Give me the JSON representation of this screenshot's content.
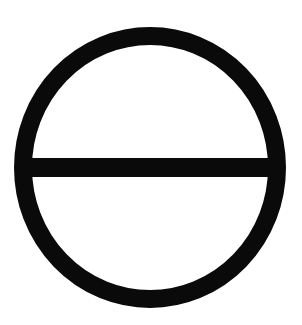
{
  "symbol": {
    "name": "circle-with-horizontal-bar",
    "colors": {
      "stroke": "#0a0a0a",
      "background": "#ffffff"
    },
    "circle": {
      "cx": 150,
      "cy": 167.5,
      "rx": 127,
      "ry": 131.5,
      "stroke_width": 18
    },
    "bar": {
      "x1": 28,
      "x2": 272,
      "y": 167.5,
      "thickness": 19
    }
  }
}
